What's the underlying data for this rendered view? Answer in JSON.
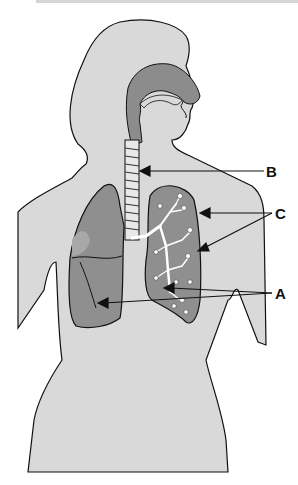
{
  "diagram": {
    "labels": [
      {
        "id": "B",
        "text": "B",
        "points_to": "trachea",
        "x": 266,
        "y": 164
      },
      {
        "id": "C",
        "text": "C",
        "points_to": "bronchioles",
        "x": 275,
        "y": 206
      },
      {
        "id": "A",
        "text": "A",
        "points_to": "lungs / bronchi",
        "x": 275,
        "y": 286
      }
    ],
    "colors": {
      "body_fill": "#d9d9d9",
      "airway_fill": "#8c8c8c",
      "lung_fill": "#8f8f8f",
      "lung_dark": "#6e6e6e",
      "outline": "#111111",
      "background": "#ffffff"
    }
  }
}
